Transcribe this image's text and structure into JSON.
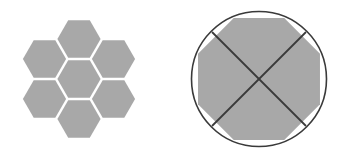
{
  "canvas": {
    "width": 344,
    "height": 158,
    "background_color": "#ffffff"
  },
  "palette": {
    "shape_fill": "#a8a8a8",
    "outline_stroke": "#3a3a3a",
    "diagonal_stroke": "#3a3a3a",
    "gap_color": "#ffffff"
  },
  "figures": [
    {
      "id": "hexagon-cluster",
      "name": "Hexagon Flower Cluster",
      "type": "hexagon-tiling",
      "orientation": "flat-top",
      "count": 7,
      "center": {
        "x": 79,
        "y": 79
      },
      "hex_radius": 22.5,
      "hex_gap": 1.8,
      "fill": "#a8a8a8",
      "cells": [
        {
          "label": "center",
          "cx": 79,
          "cy": 79
        },
        {
          "label": "top",
          "cx": 79,
          "cy": 39
        },
        {
          "label": "upper-right",
          "cx": 113.5,
          "cy": 59
        },
        {
          "label": "lower-right",
          "cx": 113.5,
          "cy": 99
        },
        {
          "label": "bottom",
          "cx": 79,
          "cy": 119
        },
        {
          "label": "lower-left",
          "cx": 44.5,
          "cy": 99
        },
        {
          "label": "upper-left",
          "cx": 44.5,
          "cy": 59
        }
      ]
    },
    {
      "id": "circle-octagon",
      "name": "Circle with Inscribed Octagon and Diagonals",
      "type": "circle-inscribed-octagon",
      "circle": {
        "cx": 259,
        "cy": 79,
        "r": 67.5,
        "stroke": "#3a3a3a",
        "stroke_width": 1.6,
        "fill": "none"
      },
      "octagon": {
        "cx": 259,
        "cy": 79,
        "circumradius": 66,
        "sides": 8,
        "rotation_deg": 22.5,
        "fill": "#a8a8a8"
      },
      "diagonals": [
        {
          "label": "diagonal-nw-se",
          "x1": 212,
          "y1": 32,
          "x2": 306,
          "y2": 126
        },
        {
          "label": "diagonal-ne-sw",
          "x1": 306,
          "y1": 32,
          "x2": 212,
          "y2": 126
        }
      ],
      "diagonal_stroke": "#3a3a3a",
      "diagonal_stroke_width": 1.8
    }
  ]
}
